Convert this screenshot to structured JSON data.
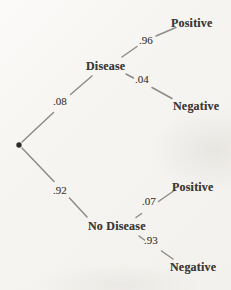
{
  "diagram": {
    "type": "probability-tree",
    "root": {
      "symbol": "dot"
    },
    "nodes": {
      "disease": {
        "label": "Disease",
        "probability": ".08"
      },
      "no_disease": {
        "label": "No Disease",
        "probability": ".92"
      }
    },
    "outcomes": {
      "disease_positive": {
        "label": "Positive",
        "probability": ".96"
      },
      "disease_negative": {
        "label": "Negative",
        "probability": ".04"
      },
      "no_disease_positive": {
        "label": "Positive",
        "probability": ".07"
      },
      "no_disease_negative": {
        "label": "Negative",
        "probability": ".93"
      }
    },
    "colors": {
      "background": "#f6f4f1",
      "line": "#8f8c87",
      "text": "#3d3936"
    }
  }
}
